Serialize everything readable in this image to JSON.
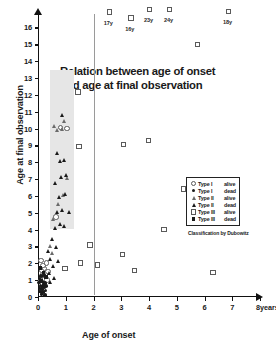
{
  "chart_data": {
    "type": "scatter",
    "title": "Relation between age of onset and age at final observation",
    "title_lines": [
      "Relation between age of onset",
      "and age at final observation"
    ],
    "xlabel": "Age of onset",
    "ylabel": "Age at final observation",
    "x_unit_label": "8years",
    "xlim": [
      0,
      8
    ],
    "ylim": [
      0,
      16.8
    ],
    "xticks": [
      0,
      1,
      2,
      3,
      4,
      5,
      6,
      7,
      8
    ],
    "xtick_labels": [
      "0",
      "1",
      "2",
      "3",
      "4",
      "5",
      "6",
      "7",
      "8"
    ],
    "yticks": [
      0,
      1,
      2,
      3,
      4,
      5,
      6,
      7,
      8,
      9,
      10,
      11,
      12,
      13,
      14,
      15,
      16
    ],
    "ytick_labels": [
      "0",
      "1",
      "2",
      "3",
      "4",
      "5",
      "6",
      "7",
      "8",
      "9",
      "10",
      "11",
      "12",
      "13",
      "14",
      "15",
      "16"
    ],
    "grid": false,
    "legend_position": "center-right",
    "legend_title": "",
    "credit": "Classification by Dubowitz",
    "shaded_band": {
      "x_start": 0.42,
      "x_end": 1.28,
      "y_start": 4.05,
      "y_end": 13.45,
      "color": "#e6e6e6"
    },
    "separator_line_x": 2.0,
    "annotations": [
      {
        "label": "17y",
        "x": 2.55,
        "y": 16.45
      },
      {
        "label": "16y",
        "x": 3.32,
        "y": 16.1
      },
      {
        "label": "23y",
        "x": 4.0,
        "y": 16.62
      },
      {
        "label": "24y",
        "x": 4.72,
        "y": 16.62
      },
      {
        "label": "18y",
        "x": 6.85,
        "y": 16.5
      }
    ],
    "series": [
      {
        "name": "Type I alive",
        "marker": "circle-open",
        "points": [
          {
            "x": 0.09,
            "y": 1.02
          },
          {
            "x": 0.2,
            "y": 1.12
          },
          {
            "x": 0.3,
            "y": 1.05
          },
          {
            "x": 0.14,
            "y": 1.35
          },
          {
            "x": 0.26,
            "y": 1.42
          },
          {
            "x": 0.1,
            "y": 1.62
          },
          {
            "x": 0.22,
            "y": 1.75
          },
          {
            "x": 0.33,
            "y": 1.55
          },
          {
            "x": 0.16,
            "y": 1.92
          },
          {
            "x": 0.29,
            "y": 2.05
          },
          {
            "x": 0.08,
            "y": 2.22
          },
          {
            "x": 0.62,
            "y": 4.78
          },
          {
            "x": 0.78,
            "y": 10.12
          },
          {
            "x": 1.02,
            "y": 10.05
          }
        ]
      },
      {
        "name": "Type I dead",
        "marker": "circle-fill",
        "points": [
          {
            "x": 0.06,
            "y": 0.52
          },
          {
            "x": 0.15,
            "y": 0.45
          },
          {
            "x": 0.24,
            "y": 0.55
          },
          {
            "x": 0.1,
            "y": 0.68
          },
          {
            "x": 0.2,
            "y": 0.75
          },
          {
            "x": 0.3,
            "y": 0.65
          },
          {
            "x": 0.05,
            "y": 0.85
          },
          {
            "x": 0.17,
            "y": 0.92
          },
          {
            "x": 0.27,
            "y": 0.82
          },
          {
            "x": 0.12,
            "y": 1.22
          },
          {
            "x": 0.22,
            "y": 1.28
          },
          {
            "x": 0.08,
            "y": 0.32
          },
          {
            "x": 0.19,
            "y": 0.28
          },
          {
            "x": 0.28,
            "y": 0.38
          },
          {
            "x": 0.14,
            "y": 0.15
          },
          {
            "x": 0.25,
            "y": 0.12
          },
          {
            "x": 0.06,
            "y": 1.08
          }
        ]
      },
      {
        "name": "Type II alive",
        "marker": "triangle-open",
        "points": [
          {
            "x": 0.55,
            "y": 4.62
          },
          {
            "x": 0.72,
            "y": 5.52
          },
          {
            "x": 0.9,
            "y": 6.08
          },
          {
            "x": 1.05,
            "y": 7.05
          },
          {
            "x": 0.68,
            "y": 9.92
          },
          {
            "x": 0.86,
            "y": 9.95
          },
          {
            "x": 0.95,
            "y": 10.45
          },
          {
            "x": 0.58,
            "y": 10.18
          },
          {
            "x": 0.5,
            "y": 2.62
          },
          {
            "x": 0.42,
            "y": 3.02
          }
        ]
      },
      {
        "name": "Type II dead",
        "marker": "triangle-fill",
        "points": [
          {
            "x": 0.62,
            "y": 4.12
          },
          {
            "x": 0.8,
            "y": 4.35
          },
          {
            "x": 0.95,
            "y": 4.22
          },
          {
            "x": 0.7,
            "y": 5.05
          },
          {
            "x": 0.88,
            "y": 5.18
          },
          {
            "x": 1.12,
            "y": 5.02
          },
          {
            "x": 0.75,
            "y": 5.95
          },
          {
            "x": 0.98,
            "y": 6.12
          },
          {
            "x": 0.6,
            "y": 6.78
          },
          {
            "x": 0.83,
            "y": 7.12
          },
          {
            "x": 1.0,
            "y": 7.25
          },
          {
            "x": 0.78,
            "y": 8.05
          },
          {
            "x": 0.92,
            "y": 8.12
          },
          {
            "x": 0.68,
            "y": 8.52
          },
          {
            "x": 0.85,
            "y": 10.82
          },
          {
            "x": 0.55,
            "y": 1.85
          },
          {
            "x": 0.45,
            "y": 2.28
          },
          {
            "x": 0.38,
            "y": 1.45
          },
          {
            "x": 0.5,
            "y": 3.45
          },
          {
            "x": 0.65,
            "y": 2.95
          },
          {
            "x": 0.58,
            "y": 1.15
          },
          {
            "x": 0.72,
            "y": 2.15
          },
          {
            "x": 0.42,
            "y": 0.92
          },
          {
            "x": 0.35,
            "y": 2.72
          }
        ]
      },
      {
        "name": "Type III alive",
        "marker": "square-open",
        "points": [
          {
            "x": 1.42,
            "y": 12.22
          },
          {
            "x": 1.45,
            "y": 8.98
          },
          {
            "x": 1.5,
            "y": 2.05
          },
          {
            "x": 0.95,
            "y": 1.72
          },
          {
            "x": 2.55,
            "y": 16.95
          },
          {
            "x": 3.32,
            "y": 16.6
          },
          {
            "x": 4.0,
            "y": 17.1
          },
          {
            "x": 4.72,
            "y": 17.1
          },
          {
            "x": 6.85,
            "y": 17.0
          },
          {
            "x": 5.72,
            "y": 15.02
          },
          {
            "x": 3.05,
            "y": 9.08
          },
          {
            "x": 3.95,
            "y": 9.32
          },
          {
            "x": 5.22,
            "y": 6.45
          },
          {
            "x": 4.52,
            "y": 4.05
          },
          {
            "x": 3.02,
            "y": 2.55
          },
          {
            "x": 3.45,
            "y": 1.62
          },
          {
            "x": 6.28,
            "y": 1.48
          },
          {
            "x": 2.12,
            "y": 1.95
          },
          {
            "x": 1.85,
            "y": 3.12
          }
        ]
      },
      {
        "name": "Type III dead",
        "marker": "square-fill",
        "points": [
          {
            "x": 0.12,
            "y": 0.95
          },
          {
            "x": 0.2,
            "y": 1.45
          },
          {
            "x": 0.3,
            "y": 1.18
          },
          {
            "x": 0.07,
            "y": 1.72
          },
          {
            "x": 0.18,
            "y": 0.62
          }
        ]
      }
    ]
  },
  "legend": {
    "rows": [
      {
        "symbol": "circle-open",
        "type": "Type I",
        "status": "alive"
      },
      {
        "symbol": "circle-fill",
        "type": "Type I",
        "status": "dead"
      },
      {
        "symbol": "triangle-open",
        "type": "Type II",
        "status": "alive"
      },
      {
        "symbol": "triangle-fill",
        "type": "Type II",
        "status": "dead"
      },
      {
        "symbol": "square-open",
        "type": "Type III",
        "status": "alive"
      },
      {
        "symbol": "square-fill",
        "type": "Type III",
        "status": "dead"
      }
    ]
  }
}
